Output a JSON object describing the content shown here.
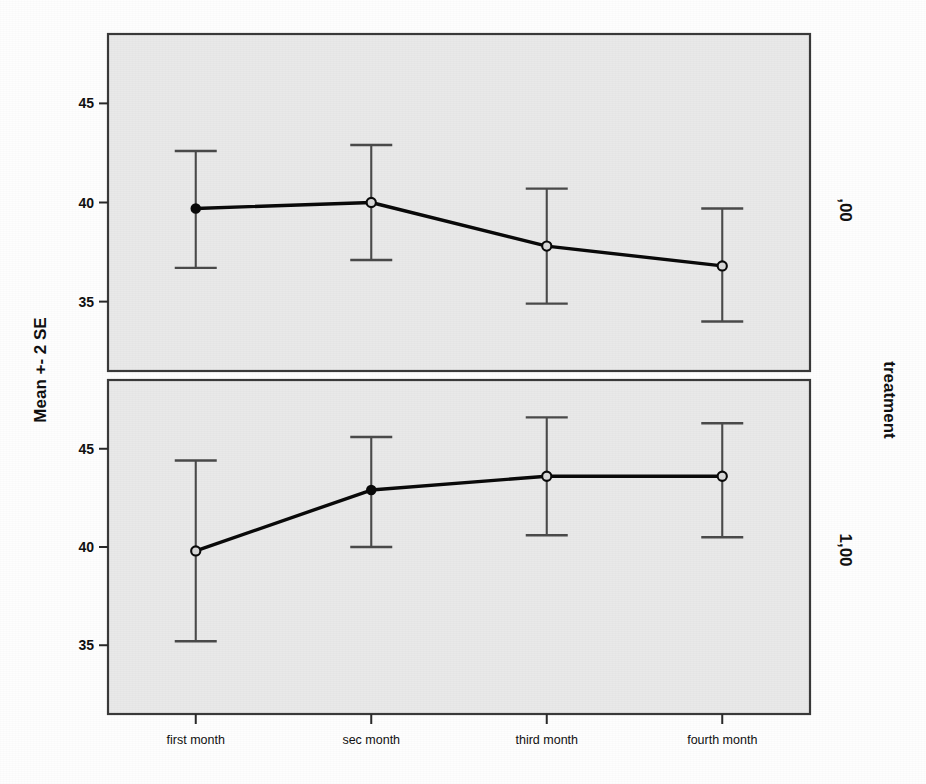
{
  "chart_data": {
    "type": "line",
    "title": "",
    "subtitle": "",
    "xlabel": "",
    "ylabel": "Mean +- 2 SE",
    "panel_axis_label": "treatment",
    "categories": [
      "first month",
      "sec month",
      "third month",
      "fourth month"
    ],
    "ytick_labels": [
      "45",
      "40",
      "35"
    ],
    "ytick_values": [
      45,
      40,
      35
    ],
    "ylim": [
      31.5,
      48.5
    ],
    "grid": false,
    "legend": "none",
    "error_bar_type": "Mean +- 2 SE",
    "panels": [
      {
        "panel_label": ",00",
        "panel_value": "0,00",
        "series_name": ",00",
        "values": [
          39.7,
          40.0,
          37.8,
          36.8
        ],
        "upper": [
          42.6,
          42.9,
          40.7,
          39.7
        ],
        "lower": [
          36.7,
          37.1,
          34.9,
          34.0
        ],
        "marker_style": [
          "filled",
          "open",
          "open",
          "open"
        ]
      },
      {
        "panel_label": "1,00",
        "panel_value": "1,00",
        "series_name": "1,00",
        "values": [
          39.8,
          42.9,
          43.6,
          43.6
        ],
        "upper": [
          44.4,
          45.6,
          46.6,
          46.3
        ],
        "lower": [
          35.2,
          40.0,
          40.6,
          40.5
        ],
        "marker_style": [
          "open",
          "filled",
          "open",
          "open"
        ]
      }
    ]
  },
  "axes": {
    "y_title": "Mean +- 2 SE",
    "panel_title": "treatment"
  },
  "colors": {
    "panel_background": "#e9e9e9",
    "frame": "#3a3a3a",
    "line": "#0a0a0a",
    "error_bar": "#4a4a4a",
    "text": "#111111",
    "page_background": "#fefefe"
  }
}
